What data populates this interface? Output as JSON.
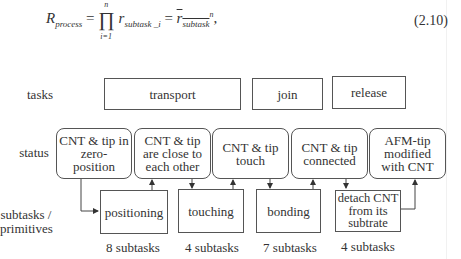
{
  "equation": {
    "lhs": "R",
    "lhs_sub": "process",
    "prod_upper": "n",
    "prod_lower": "i=1",
    "term": "r",
    "term_sub": "subtask _i",
    "rhs": "r",
    "rhs_sub": "subtask",
    "rhs_exp": "n",
    "number": "(2.10)"
  },
  "row_labels": {
    "tasks": "tasks",
    "status": "status",
    "subtasks": "subtasks /",
    "primitives": "primitives"
  },
  "tasks": [
    {
      "label": "transport"
    },
    {
      "label": "join"
    },
    {
      "label": "release"
    }
  ],
  "status": [
    {
      "lines": [
        "CNT & tip in",
        "zero-",
        "position"
      ]
    },
    {
      "lines": [
        "CNT & tip",
        "are close to",
        "each other"
      ]
    },
    {
      "lines": [
        "CNT & tip",
        "touch"
      ]
    },
    {
      "lines": [
        "CNT & tip",
        "connected"
      ]
    },
    {
      "lines": [
        "AFM-tip",
        "modified",
        "with CNT"
      ]
    }
  ],
  "subtasks": [
    {
      "lines": [
        "positioning"
      ],
      "count": "8 subtasks"
    },
    {
      "lines": [
        "touching"
      ],
      "count": "4 subtasks"
    },
    {
      "lines": [
        "bonding"
      ],
      "count": "7 subtasks"
    },
    {
      "lines": [
        "detach CNT",
        "from its",
        "subtrate"
      ],
      "count": "4 subtasks"
    }
  ]
}
